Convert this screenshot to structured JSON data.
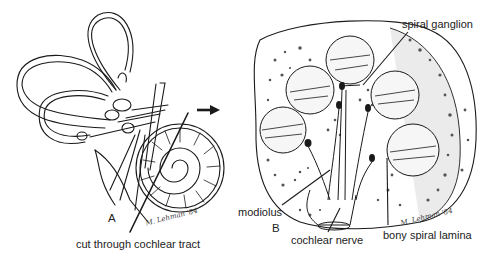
{
  "figure": {
    "panel_a": {
      "letter": "A",
      "caption": "cut through cochlear tract",
      "signature": "M. Lehman '84"
    },
    "panel_b": {
      "letter": "B",
      "signature": "M. Lehman '84",
      "labels": {
        "spiral_ganglion": "spiral ganglion",
        "modiolus": "modiolus",
        "cochlear_nerve": "cochlear nerve",
        "bony_spiral_lamina": "bony spiral lamina"
      }
    },
    "arrow_direction": "right",
    "colors": {
      "ink": "#1a1a1a",
      "background": "#ffffff",
      "stipple": "#555555",
      "shade": "#d8d8d8"
    }
  }
}
